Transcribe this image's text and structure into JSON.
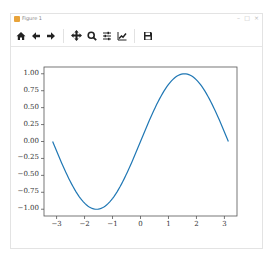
{
  "window": {
    "title": "Figure 1",
    "controls": [
      "–",
      "□",
      "×"
    ]
  },
  "toolbar": {
    "buttons": [
      {
        "name": "home",
        "icon": "home-icon",
        "glyph": "⌂"
      },
      {
        "name": "back",
        "icon": "arrow-left-icon",
        "glyph": "←"
      },
      {
        "name": "forward",
        "icon": "arrow-right-icon",
        "glyph": "→"
      },
      {
        "name": "pan",
        "icon": "move-icon",
        "glyph": "✥"
      },
      {
        "name": "zoom",
        "icon": "magnifier-icon",
        "glyph": "🔍"
      },
      {
        "name": "configure-subplots",
        "icon": "sliders-icon",
        "glyph": "≡"
      },
      {
        "name": "edit-axis",
        "icon": "line-chart-icon",
        "glyph": "📈"
      },
      {
        "name": "save",
        "icon": "floppy-disk-icon",
        "glyph": "💾"
      }
    ]
  },
  "chart_data": {
    "type": "line",
    "title": "",
    "xlabel": "",
    "ylabel": "",
    "xlim": [
      -3.45,
      3.45
    ],
    "ylim": [
      -1.1,
      1.1
    ],
    "grid": false,
    "x_ticks": [
      "−3",
      "−2",
      "−1",
      "0",
      "1",
      "2",
      "3"
    ],
    "x_tick_values": [
      -3,
      -2,
      -1,
      0,
      1,
      2,
      3
    ],
    "y_ticks": [
      "1.00",
      "0.75",
      "0.50",
      "0.25",
      "0.00",
      "−0.25",
      "−0.50",
      "−0.75",
      "−1.00"
    ],
    "y_tick_values": [
      1.0,
      0.75,
      0.5,
      0.25,
      0.0,
      -0.25,
      -0.5,
      -0.75,
      -1.0
    ],
    "series": [
      {
        "name": "sin(x)",
        "function": "sin",
        "x_range": [
          -3.14159,
          3.14159
        ],
        "color": "#1f77b4"
      }
    ]
  },
  "colors": {
    "line": "#1f77b4",
    "axis": "#555555",
    "toolbar_icon": "#222222"
  }
}
